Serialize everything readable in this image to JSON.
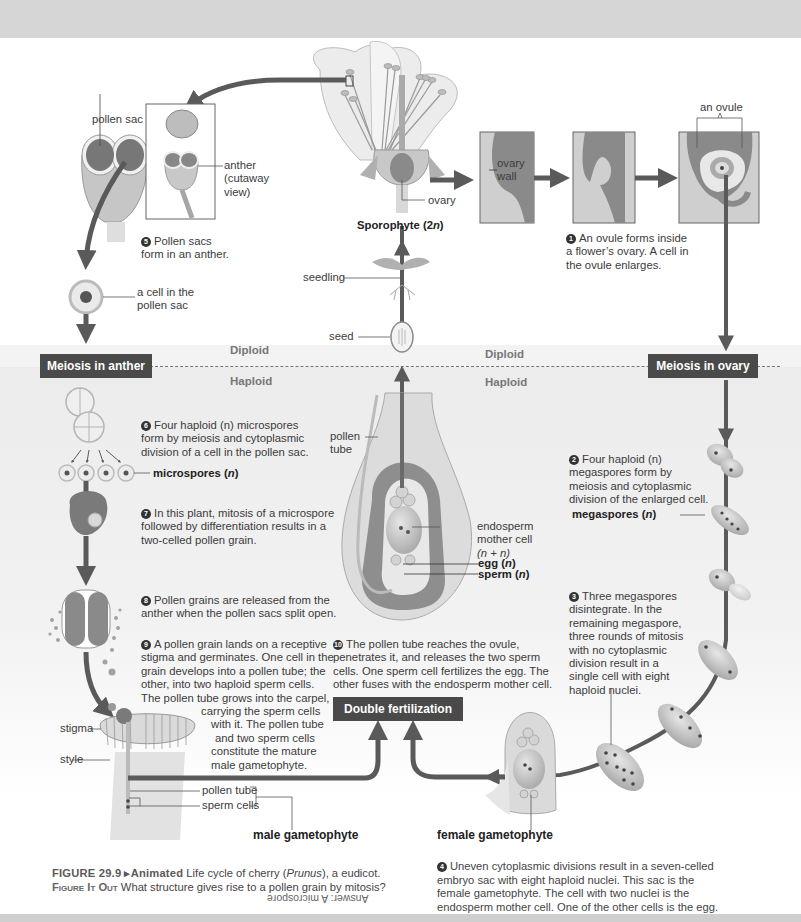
{
  "figure": {
    "number": "FIGURE 29.9",
    "animated_label": "▸Animated",
    "title": "Life cycle of cherry (Prunus), a eudicot.",
    "title_pre": "Life cycle of cherry (",
    "title_italic": "Prunus",
    "title_post": "), a eudicot.",
    "figure_it_out_label": "Figure It Out",
    "question": "What structure gives rise to a pollen grain by mitosis?",
    "answer": "Answer: A microspore"
  },
  "zones": {
    "diploid": "Diploid",
    "haploid": "Haploid"
  },
  "boxes": {
    "meiosis_anther": "Meiosis in anther",
    "meiosis_ovary": "Meiosis in ovary",
    "double_fertilization": "Double fertilization"
  },
  "labels": {
    "pollen_sac": "pollen sac",
    "anther_line1": "anther",
    "anther_line2": "(cutaway",
    "anther_line3": "view)",
    "ovary": "ovary",
    "sporophyte": "Sporophyte (2n)",
    "ovary_wall_1": "ovary",
    "ovary_wall_2": "wall",
    "an_ovule": "an ovule",
    "cell_in_pollen_sac_1": "a cell in the",
    "cell_in_pollen_sac_2": "pollen sac",
    "seedling": "seedling",
    "seed": "seed",
    "microspores": "microspores (n)",
    "megaspores": "megaspores (n)",
    "pollen_tube_1": "pollen",
    "pollen_tube_2": "tube",
    "endosperm_1": "endosperm",
    "endosperm_2": "mother cell",
    "endosperm_3": "(n + n)",
    "egg": "egg (n)",
    "sperm": "sperm (n)",
    "stigma": "stigma",
    "style": "style",
    "pollen_tube_bottom": "pollen tube",
    "sperm_cells": "sperm cells",
    "male_gametophyte": "male gametophyte",
    "female_gametophyte": "female gametophyte"
  },
  "steps": [
    {
      "n": "1",
      "text": "An ovule forms inside a flower’s ovary. A cell in the ovule enlarges.",
      "lines": [
        "An ovule forms inside",
        "a flower’s ovary. A cell in",
        "the ovule enlarges."
      ]
    },
    {
      "n": "2",
      "text": "Four haploid (n) megaspores form by meiosis and cytoplasmic division of the enlarged cell.",
      "lines": [
        "Four haploid (n)",
        "megaspores form by",
        "meiosis and cytoplasmic",
        "division of the enlarged cell."
      ]
    },
    {
      "n": "3",
      "text": "Three megaspores disintegrate. In the remaining megaspore, three rounds of mitosis with no cytoplasmic division result in a single cell with eight haploid nuclei.",
      "lines": [
        "Three megaspores",
        "disintegrate. In the",
        "remaining megaspore,",
        "three rounds of mitosis",
        "with no cytoplasmic",
        "division result in a",
        "single cell with eight",
        "haploid nuclei."
      ]
    },
    {
      "n": "4",
      "text": "Uneven cytoplasmic divisions result in a seven-celled embryo sac with eight haploid nuclei. This sac is the female gametophyte. The cell with two nuclei is the endosperm mother cell. One of the other cells is the egg.",
      "lines": [
        "Uneven cytoplasmic divisions result in a seven-celled",
        "embryo sac with eight haploid nuclei. This sac is the",
        "female gametophyte. The cell with two nuclei is the",
        "endosperm mother cell. One of the other cells is the egg."
      ]
    },
    {
      "n": "5",
      "text": "Pollen sacs form in an anther.",
      "lines": [
        "Pollen sacs",
        "form in an anther."
      ]
    },
    {
      "n": "6",
      "text": "Four haploid (n) microspores form by meiosis and cytoplasmic division of a cell in the pollen sac.",
      "lines": [
        "Four haploid (n) microspores",
        "form by meiosis and cytoplasmic",
        "division of a cell in the pollen sac."
      ]
    },
    {
      "n": "7",
      "text": "In this plant, mitosis of a microspore followed by differentiation results in a two-celled pollen grain.",
      "lines": [
        "In this plant, mitosis of a microspore",
        "followed by differentiation results in a",
        "two-celled pollen grain."
      ]
    },
    {
      "n": "8",
      "text": "Pollen grains are released from the anther when the pollen sacs split open.",
      "lines": [
        "Pollen grains are released from the",
        "anther when the pollen sacs split open."
      ]
    },
    {
      "n": "9",
      "text": "A pollen grain lands on a receptive stigma and germinates. One cell in the grain develops into a pollen tube; the other, into two haploid sperm cells. The pollen tube grows into the carpel, carrying the sperm cells with it. The pollen tube and two sperm cells constitute the mature male gametophyte.",
      "lines": [
        "A pollen grain lands on a receptive",
        "stigma and germinates. One cell in the",
        "grain develops into a pollen tube; the",
        "other, into two haploid sperm cells.",
        "The pollen tube grows into the carpel,",
        "carrying the sperm cells",
        "with it. The pollen tube",
        "and two sperm cells",
        "constitute the mature",
        "male gametophyte."
      ]
    },
    {
      "n": "10",
      "text": "The pollen tube reaches the ovule, penetrates it, and releases the two sperm cells. One sperm cell fertilizes the egg. The other fuses with the endosperm mother cell.",
      "lines": [
        "The pollen tube reaches the ovule,",
        "penetrates it, and releases the two sperm",
        "cells. One sperm cell fertilizes the egg. The",
        "other fuses with the endosperm mother cell."
      ]
    }
  ],
  "colors": {
    "arrow": "#5a5a5a",
    "box_bg": "#4a4a4a",
    "tissue_dark": "#8a8a8a",
    "tissue_light": "#cfcfcf",
    "haploid_bg": "#ececec"
  }
}
